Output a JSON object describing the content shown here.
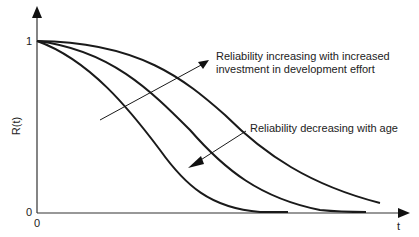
{
  "diagram": {
    "title": "",
    "axes": {
      "y_label": "R(t)",
      "x_label": "t",
      "y_tick_top": "1",
      "y_tick_bottom": "0",
      "x_tick_origin": "0"
    },
    "annotations": {
      "increasing": {
        "line1": "Reliability increasing with increased",
        "line2": "investment in development effort"
      },
      "decreasing": "Reliability decreasing with age"
    },
    "curves": [
      {
        "name": "low-investment curve",
        "description": "steepest decline, reaches 0 earliest"
      },
      {
        "name": "medium-investment curve",
        "description": "middle decline"
      },
      {
        "name": "high-investment curve",
        "description": "slowest decline"
      }
    ],
    "colors": {
      "line": "#1a1a1a",
      "axis": "#333333",
      "text": "#222222"
    }
  }
}
